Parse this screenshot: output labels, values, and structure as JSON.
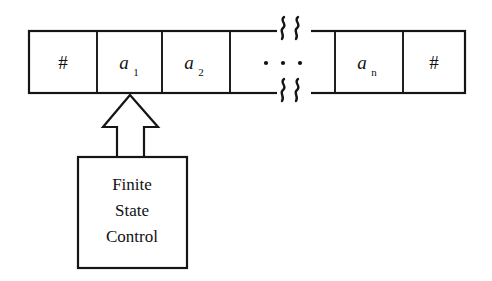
{
  "figure": {
    "background_color": "#ffffff",
    "ink_color": "#151515"
  },
  "tape": {
    "name": "input-tape",
    "left_endmarker": "#",
    "right_endmarker": "#",
    "ellipsis": "· · ·",
    "break_marks": {
      "top": "§",
      "bottom": "§",
      "count": 2,
      "description": "zigzag tape-break squiggles"
    },
    "cells": [
      {
        "id": "cell-endmarker-left",
        "symbol": "#",
        "subscript": "",
        "italic": false
      },
      {
        "id": "cell-a1",
        "symbol": "a",
        "subscript": "1",
        "italic": true
      },
      {
        "id": "cell-a2",
        "symbol": "a",
        "subscript": "2",
        "italic": true
      },
      {
        "id": "cell-ellipsis",
        "symbol": "· · ·",
        "subscript": "",
        "italic": false
      },
      {
        "id": "cell-an",
        "symbol": "a",
        "subscript": "n",
        "italic": true
      },
      {
        "id": "cell-endmarker-right",
        "symbol": "#",
        "subscript": "",
        "italic": false
      }
    ]
  },
  "head": {
    "name": "read-write-head",
    "shape": "hollow-up-arrow",
    "points_to_cell": "cell-a1"
  },
  "control_box": {
    "name": "finite-state-control",
    "lines": [
      "Finite",
      "State",
      "Control"
    ],
    "line1": "Finite",
    "line2": "State",
    "line3": "Control"
  }
}
